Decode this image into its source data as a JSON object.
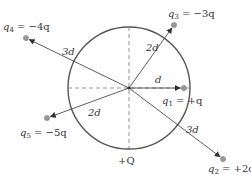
{
  "diagram": {
    "center": {
      "x": 129,
      "y": 88
    },
    "circle": {
      "radius": 61,
      "stroke": "#555555",
      "label": "+Q",
      "label_pos": {
        "x": 118,
        "y": 164
      }
    },
    "axes": {
      "style": "dashed",
      "color": "#888888"
    },
    "arrow_color": "#333333",
    "charge_color": "#999999",
    "charges": [
      {
        "id": "q1",
        "label": "q",
        "sub": "1",
        "value": "= +q",
        "x": 184,
        "y": 88,
        "dist_label": "d",
        "dist_pos": {
          "x": 155,
          "y": 83
        },
        "text_pos": {
          "x": 162,
          "y": 104
        }
      },
      {
        "id": "q2",
        "label": "q",
        "sub": "2",
        "value": "= +2q",
        "x": 223,
        "y": 159,
        "dist_label": "3d",
        "dist_pos": {
          "x": 186,
          "y": 133
        },
        "text_pos": {
          "x": 208,
          "y": 172
        }
      },
      {
        "id": "q3",
        "label": "q",
        "sub": "3",
        "value": "= −3q",
        "x": 174,
        "y": 25,
        "dist_label": "2d",
        "dist_pos": {
          "x": 146,
          "y": 51
        },
        "text_pos": {
          "x": 168,
          "y": 17
        }
      },
      {
        "id": "q4",
        "label": "q",
        "sub": "4",
        "value": "= −4q",
        "x": 26,
        "y": 38,
        "dist_label": "3d",
        "dist_pos": {
          "x": 62,
          "y": 55
        },
        "text_pos": {
          "x": 3,
          "y": 30
        }
      },
      {
        "id": "q5",
        "label": "q",
        "sub": "5",
        "value": "= −5q",
        "x": 47,
        "y": 118,
        "dist_label": "2d",
        "dist_pos": {
          "x": 88,
          "y": 116
        },
        "text_pos": {
          "x": 20,
          "y": 136
        }
      }
    ]
  }
}
